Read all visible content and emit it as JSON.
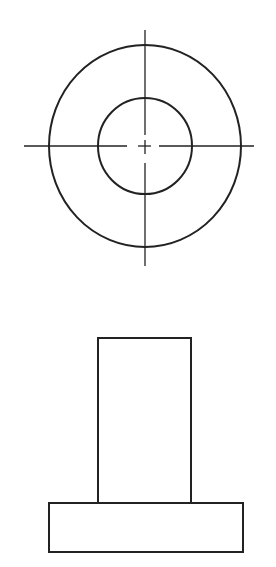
{
  "diagram": {
    "type": "orthographic-projection",
    "stroke_color": "#222222",
    "background": "#ffffff",
    "top_view": {
      "label": "top view",
      "center": [
        145,
        146
      ],
      "outer_circle": {
        "cx": 145,
        "cy": 146,
        "rx": 96,
        "ry": 101
      },
      "inner_circle": {
        "cx": 145,
        "cy": 146,
        "rx": 47,
        "ry": 48
      },
      "centerlines": {
        "horizontal": [
          {
            "x1": 24,
            "y1": 146,
            "x2": 127,
            "y2": 146
          },
          {
            "x1": 138,
            "y1": 146,
            "x2": 151,
            "y2": 146
          },
          {
            "x1": 159,
            "y1": 146,
            "x2": 254,
            "y2": 146
          }
        ],
        "vertical": [
          {
            "x1": 145,
            "y1": 30,
            "x2": 145,
            "y2": 135
          },
          {
            "x1": 145,
            "y1": 140,
            "x2": 145,
            "y2": 154
          },
          {
            "x1": 145,
            "y1": 163,
            "x2": 145,
            "y2": 266
          }
        ]
      }
    },
    "front_view": {
      "label": "front view",
      "shaft": {
        "x": 98,
        "y": 338,
        "width": 93,
        "height": 165
      },
      "base": {
        "x": 49,
        "y": 503,
        "width": 194,
        "height": 49
      }
    }
  }
}
